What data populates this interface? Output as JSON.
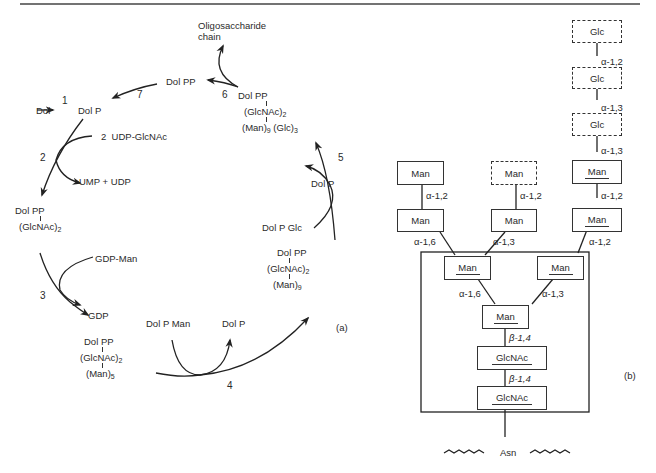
{
  "header": {
    "text": ""
  },
  "panel_a": {
    "label": "(a)",
    "nodes": {
      "dol": "Dol",
      "dol_p_start": "Dol P",
      "udp_glcnac": "UDP-GlcNAc",
      "ump_udp": "UMP + UDP",
      "dolpp_glcnac2": {
        "top": "Dol PP",
        "sub": "(GlcNAc)",
        "sub_n": "2"
      },
      "gdp_man": "GDP-Man",
      "gdp": "GDP",
      "dolpp_man5": {
        "top": "Dol PP",
        "mid": "(GlcNAc)",
        "mid_n": "2",
        "bot": "(Man)",
        "bot_n": "5"
      },
      "dol_p_man": "Dol P Man",
      "dol_p_4": "Dol P",
      "dolpp_man9": {
        "top": "Dol PP",
        "mid": "(GlcNAc)",
        "mid_n": "2",
        "bot": "(Man)",
        "bot_n": "9"
      },
      "dol_p_glc": "Dol P Glc",
      "dol_p_5": "Dol P",
      "dolpp_man9glc3": {
        "top": "Dol PP",
        "mid": "(GlcNAc)",
        "mid_n": "2",
        "bot1": "(Man)",
        "bot1_n": "9",
        "bot2": "(Glc)",
        "bot2_n": "3"
      },
      "dolpp_released": "Dol PP",
      "oligo": {
        "line1": "Oligosaccharide",
        "line2": "chain"
      }
    },
    "steps": [
      "1",
      "2",
      "2",
      "3",
      "4",
      "5",
      "6",
      "7"
    ]
  },
  "panel_b": {
    "label": "(b)",
    "boxes": {
      "glc_top": "Glc",
      "glc_mid": "Glc",
      "glc_low": "Glc",
      "man_right_top": "Man",
      "man_right_mid": "Man",
      "man_left_top": "Man",
      "man_left_mid": "Man",
      "man_center_top": "Man",
      "man_center_mid": "Man",
      "man_core_left": "Man",
      "man_core_right": "Man",
      "man_core_base": "Man",
      "glcnac_upper": "GlcNAc",
      "glcnac_lower": "GlcNAc"
    },
    "bonds": {
      "glc_top_mid": "α-1,2",
      "glc_mid_low": "α-1,3",
      "glc_low_man": "α-1,3",
      "right_man_man": "α-1,2",
      "right_to_core": "α-1,2",
      "left_man_man": "α-1,2",
      "left_to_core": "α-1,6",
      "center_man_man": "α-1,2",
      "center_to_core": "α-1,3",
      "core_left_base": "α-1,6",
      "core_right_base": "α-1,3",
      "base_glcnac": "β-1,4",
      "glcnac_glcnac": "β-1,4"
    },
    "asn": "Asn"
  }
}
